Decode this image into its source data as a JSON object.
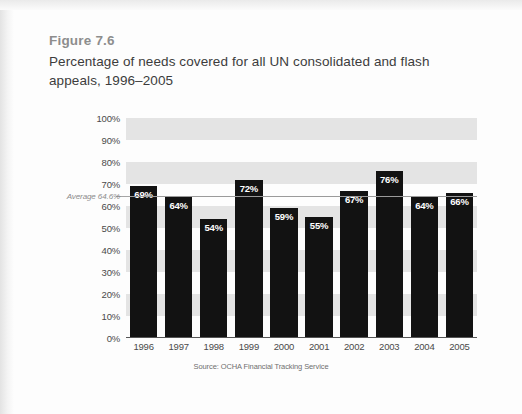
{
  "figure": {
    "label": "Figure 7.6",
    "title": "Percentage of needs covered for all UN consolidated and flash appeals, 1996–2005",
    "source": "Source: OCHA Financial Tracking Service"
  },
  "average": {
    "label": "Average 64.6%",
    "value": 64.6
  },
  "colors": {
    "bar": "#121212",
    "band": "#e4e4e4",
    "page": "#fdfdfd",
    "fig_label": "#8d8d8d",
    "title": "#3c3c3c",
    "tick": "#4a4a4a",
    "average_line": "#9a9a9a"
  },
  "chart_data": {
    "type": "bar",
    "title": "Percentage of needs covered for all UN consolidated and flash appeals, 1996–2005",
    "xlabel": "",
    "ylabel": "",
    "ylim": [
      0,
      100
    ],
    "grid": false,
    "legend": "none",
    "categories": [
      "1996",
      "1997",
      "1998",
      "1999",
      "2000",
      "2001",
      "2002",
      "2003",
      "2004",
      "2005"
    ],
    "values": [
      69,
      64,
      54,
      72,
      59,
      55,
      67,
      76,
      64,
      66
    ],
    "value_labels": [
      "69%",
      "64%",
      "54%",
      "72%",
      "59%",
      "55%",
      "67%",
      "76%",
      "64%",
      "66%"
    ],
    "ytick_labels": [
      "100%",
      "90%",
      "80%",
      "70%",
      "60%",
      "50%",
      "40%",
      "30%",
      "20%",
      "10%",
      "0%"
    ],
    "ytick_values": [
      100,
      90,
      80,
      70,
      60,
      50,
      40,
      30,
      20,
      10,
      0
    ],
    "annotations": [
      {
        "name": "average-line",
        "label": "Average 64.6%",
        "value": 64.6,
        "orientation": "horizontal"
      }
    ],
    "background_bands": [
      [
        90,
        100
      ],
      [
        70,
        80
      ],
      [
        50,
        60
      ],
      [
        30,
        40
      ],
      [
        10,
        20
      ]
    ]
  }
}
